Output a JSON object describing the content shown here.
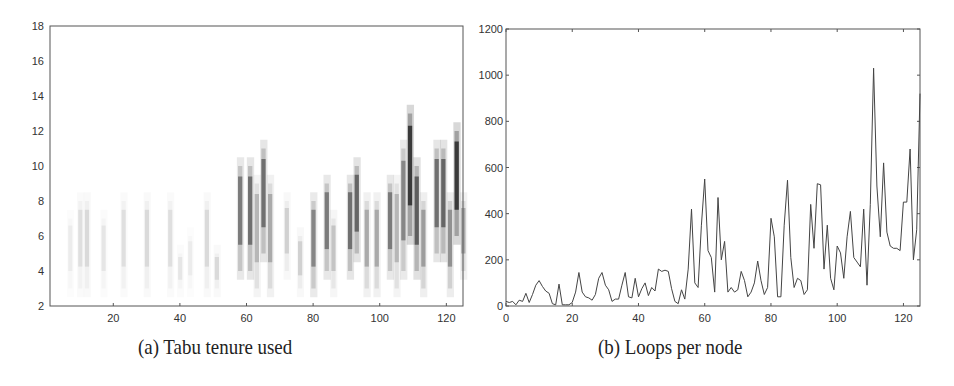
{
  "chart_data": [
    {
      "type": "heatmap",
      "title": "",
      "caption": "(a) Tabu tenure used",
      "xlabel": "",
      "ylabel": "",
      "xlim": [
        1,
        125
      ],
      "ylim": [
        2,
        18
      ],
      "xticks": [
        20,
        40,
        60,
        80,
        100,
        120
      ],
      "yticks": [
        2,
        4,
        6,
        8,
        10,
        12,
        14,
        16,
        18
      ],
      "grid": false,
      "colormap": "grayscale (white=low, black=high)",
      "columns": [
        {
          "x": 7,
          "ymin": 3,
          "ymax": 7,
          "intensity": 0.06
        },
        {
          "x": 10,
          "ymin": 3,
          "ymax": 8,
          "intensity": 0.1
        },
        {
          "x": 12,
          "ymin": 3,
          "ymax": 8,
          "intensity": 0.12
        },
        {
          "x": 17,
          "ymin": 3,
          "ymax": 7,
          "intensity": 0.08
        },
        {
          "x": 23,
          "ymin": 3,
          "ymax": 8,
          "intensity": 0.1
        },
        {
          "x": 30,
          "ymin": 3,
          "ymax": 8,
          "intensity": 0.12
        },
        {
          "x": 37,
          "ymin": 3,
          "ymax": 8,
          "intensity": 0.1
        },
        {
          "x": 40,
          "ymin": 3,
          "ymax": 5,
          "intensity": 0.08
        },
        {
          "x": 43,
          "ymin": 3,
          "ymax": 6,
          "intensity": 0.06
        },
        {
          "x": 48,
          "ymin": 3,
          "ymax": 8,
          "intensity": 0.12
        },
        {
          "x": 51,
          "ymin": 3,
          "ymax": 5,
          "intensity": 0.12
        },
        {
          "x": 58,
          "ymin": 4,
          "ymax": 10,
          "intensity": 0.5
        },
        {
          "x": 61,
          "ymin": 4,
          "ymax": 10,
          "intensity": 0.55
        },
        {
          "x": 63,
          "ymin": 3,
          "ymax": 9,
          "intensity": 0.25
        },
        {
          "x": 65,
          "ymin": 5,
          "ymax": 11,
          "intensity": 0.55
        },
        {
          "x": 67,
          "ymin": 3,
          "ymax": 9,
          "intensity": 0.3
        },
        {
          "x": 72,
          "ymin": 4,
          "ymax": 8,
          "intensity": 0.15
        },
        {
          "x": 76,
          "ymin": 3,
          "ymax": 6,
          "intensity": 0.15
        },
        {
          "x": 80,
          "ymin": 3,
          "ymax": 8,
          "intensity": 0.45
        },
        {
          "x": 84,
          "ymin": 4,
          "ymax": 9,
          "intensity": 0.5
        },
        {
          "x": 86,
          "ymin": 3,
          "ymax": 7,
          "intensity": 0.2
        },
        {
          "x": 91,
          "ymin": 4,
          "ymax": 9,
          "intensity": 0.55
        },
        {
          "x": 93,
          "ymin": 5,
          "ymax": 10,
          "intensity": 0.6
        },
        {
          "x": 96,
          "ymin": 3,
          "ymax": 8,
          "intensity": 0.3
        },
        {
          "x": 99,
          "ymin": 3,
          "ymax": 8,
          "intensity": 0.3
        },
        {
          "x": 103,
          "ymin": 4,
          "ymax": 9,
          "intensity": 0.5
        },
        {
          "x": 105,
          "ymin": 3,
          "ymax": 9,
          "intensity": 0.25
        },
        {
          "x": 107,
          "ymin": 4,
          "ymax": 11,
          "intensity": 0.45
        },
        {
          "x": 109,
          "ymin": 6,
          "ymax": 13,
          "intensity": 0.85
        },
        {
          "x": 111,
          "ymin": 4,
          "ymax": 10,
          "intensity": 0.65
        },
        {
          "x": 113,
          "ymin": 3,
          "ymax": 8,
          "intensity": 0.35
        },
        {
          "x": 117,
          "ymin": 5,
          "ymax": 11,
          "intensity": 0.55
        },
        {
          "x": 119,
          "ymin": 5,
          "ymax": 11,
          "intensity": 0.6
        },
        {
          "x": 121,
          "ymin": 3,
          "ymax": 8,
          "intensity": 0.4
        },
        {
          "x": 123,
          "ymin": 6,
          "ymax": 12,
          "intensity": 0.85
        },
        {
          "x": 125,
          "ymin": 4,
          "ymax": 8,
          "intensity": 0.3
        }
      ]
    },
    {
      "type": "line",
      "title": "",
      "caption": "(b) Loops per node",
      "xlabel": "",
      "ylabel": "",
      "xlim": [
        0,
        125
      ],
      "ylim": [
        0,
        1200
      ],
      "xticks": [
        0,
        20,
        40,
        60,
        80,
        100,
        120
      ],
      "yticks": [
        0,
        200,
        400,
        600,
        800,
        1000,
        1200
      ],
      "grid": false,
      "series": [
        {
          "name": "loops",
          "color": "#444444",
          "x": [
            0,
            1,
            2,
            3,
            4,
            5,
            6,
            7,
            8,
            9,
            10,
            11,
            12,
            13,
            14,
            15,
            16,
            17,
            18,
            19,
            20,
            21,
            22,
            23,
            24,
            25,
            26,
            27,
            28,
            29,
            30,
            31,
            32,
            33,
            34,
            35,
            36,
            37,
            38,
            39,
            40,
            41,
            42,
            43,
            44,
            45,
            46,
            47,
            48,
            49,
            50,
            51,
            52,
            53,
            54,
            55,
            56,
            57,
            58,
            59,
            60,
            61,
            62,
            63,
            64,
            65,
            66,
            67,
            68,
            69,
            70,
            71,
            72,
            73,
            74,
            75,
            76,
            77,
            78,
            79,
            80,
            81,
            82,
            83,
            84,
            85,
            86,
            87,
            88,
            89,
            90,
            91,
            92,
            93,
            94,
            95,
            96,
            97,
            98,
            99,
            100,
            101,
            102,
            103,
            104,
            105,
            106,
            107,
            108,
            109,
            110,
            111,
            112,
            113,
            114,
            115,
            116,
            117,
            118,
            119,
            120,
            121,
            122,
            123,
            124,
            125
          ],
          "values": [
            20,
            15,
            20,
            5,
            25,
            20,
            55,
            15,
            50,
            90,
            110,
            85,
            65,
            55,
            10,
            5,
            95,
            5,
            5,
            5,
            15,
            60,
            145,
            60,
            40,
            35,
            25,
            50,
            120,
            145,
            90,
            70,
            20,
            30,
            30,
            90,
            145,
            40,
            35,
            120,
            40,
            75,
            100,
            45,
            80,
            65,
            160,
            150,
            155,
            150,
            75,
            20,
            10,
            70,
            30,
            160,
            420,
            100,
            80,
            350,
            550,
            240,
            210,
            60,
            470,
            200,
            280,
            60,
            80,
            60,
            70,
            150,
            110,
            40,
            60,
            100,
            195,
            110,
            50,
            80,
            380,
            300,
            40,
            40,
            350,
            545,
            210,
            80,
            120,
            110,
            50,
            70,
            440,
            250,
            530,
            525,
            160,
            350,
            120,
            70,
            260,
            230,
            120,
            300,
            410,
            210,
            190,
            170,
            420,
            90,
            440,
            1030,
            520,
            300,
            620,
            320,
            260,
            250,
            250,
            240,
            450,
            450,
            680,
            200,
            330,
            920,
            800,
            680,
            210,
            510
          ]
        }
      ]
    }
  ],
  "captions": {
    "left": "(a) Tabu tenure used",
    "right": "(b) Loops per node"
  }
}
